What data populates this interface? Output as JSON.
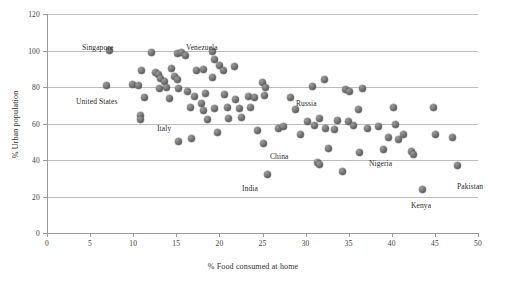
{
  "chart_data": {
    "type": "scatter",
    "title": "",
    "xlabel": "% Food consumed at home",
    "ylabel": "% Urban population",
    "xlim": [
      0,
      50
    ],
    "ylim": [
      0,
      120
    ],
    "xticks": [
      0,
      5,
      10,
      15,
      20,
      25,
      30,
      35,
      40,
      45,
      50
    ],
    "yticks": [
      0,
      20,
      40,
      60,
      80,
      100,
      120
    ],
    "grid": "horizontal",
    "legend": "none",
    "marker_color": "#6b6b6b",
    "points": [
      {
        "x": 7.2,
        "y": 100.0,
        "label": "Singapore"
      },
      {
        "x": 6.9,
        "y": 81.0,
        "label": ""
      },
      {
        "x": 9.9,
        "y": 81.3,
        "label": "United States"
      },
      {
        "x": 10.6,
        "y": 81.0,
        "label": ""
      },
      {
        "x": 11.0,
        "y": 89.0,
        "label": ""
      },
      {
        "x": 11.3,
        "y": 74.0,
        "label": ""
      },
      {
        "x": 10.9,
        "y": 64.5,
        "label": ""
      },
      {
        "x": 10.8,
        "y": 62.0,
        "label": ""
      },
      {
        "x": 12.1,
        "y": 99.0,
        "label": ""
      },
      {
        "x": 12.6,
        "y": 88.0,
        "label": ""
      },
      {
        "x": 12.9,
        "y": 87.0,
        "label": ""
      },
      {
        "x": 13.2,
        "y": 84.5,
        "label": ""
      },
      {
        "x": 13.6,
        "y": 83.0,
        "label": ""
      },
      {
        "x": 13.0,
        "y": 79.0,
        "label": ""
      },
      {
        "x": 13.9,
        "y": 80.0,
        "label": ""
      },
      {
        "x": 14.2,
        "y": 73.5,
        "label": "Italy"
      },
      {
        "x": 14.4,
        "y": 90.0,
        "label": ""
      },
      {
        "x": 14.8,
        "y": 86.0,
        "label": ""
      },
      {
        "x": 15.1,
        "y": 84.0,
        "label": ""
      },
      {
        "x": 15.3,
        "y": 79.0,
        "label": ""
      },
      {
        "x": 15.3,
        "y": 50.0,
        "label": ""
      },
      {
        "x": 15.1,
        "y": 98.5,
        "label": ""
      },
      {
        "x": 15.6,
        "y": 99.0,
        "label": ""
      },
      {
        "x": 16.1,
        "y": 97.5,
        "label": ""
      },
      {
        "x": 16.3,
        "y": 77.5,
        "label": ""
      },
      {
        "x": 16.6,
        "y": 68.5,
        "label": ""
      },
      {
        "x": 16.8,
        "y": 52.0,
        "label": ""
      },
      {
        "x": 17.4,
        "y": 89.0,
        "label": ""
      },
      {
        "x": 17.1,
        "y": 75.0,
        "label": ""
      },
      {
        "x": 17.9,
        "y": 71.0,
        "label": ""
      },
      {
        "x": 18.2,
        "y": 89.5,
        "label": ""
      },
      {
        "x": 18.4,
        "y": 76.5,
        "label": ""
      },
      {
        "x": 18.2,
        "y": 67.0,
        "label": ""
      },
      {
        "x": 18.6,
        "y": 62.0,
        "label": ""
      },
      {
        "x": 19.2,
        "y": 85.0,
        "label": ""
      },
      {
        "x": 19.4,
        "y": 68.0,
        "label": ""
      },
      {
        "x": 19.8,
        "y": 55.0,
        "label": ""
      },
      {
        "x": 19.2,
        "y": 99.5,
        "label": "Venezuela"
      },
      {
        "x": 19.4,
        "y": 95.0,
        "label": ""
      },
      {
        "x": 20.0,
        "y": 92.0,
        "label": ""
      },
      {
        "x": 20.5,
        "y": 89.0,
        "label": ""
      },
      {
        "x": 20.6,
        "y": 76.0,
        "label": ""
      },
      {
        "x": 20.9,
        "y": 68.5,
        "label": ""
      },
      {
        "x": 21.1,
        "y": 62.5,
        "label": ""
      },
      {
        "x": 21.8,
        "y": 91.0,
        "label": ""
      },
      {
        "x": 21.9,
        "y": 73.0,
        "label": ""
      },
      {
        "x": 22.3,
        "y": 68.0,
        "label": ""
      },
      {
        "x": 22.6,
        "y": 63.5,
        "label": ""
      },
      {
        "x": 23.4,
        "y": 75.0,
        "label": ""
      },
      {
        "x": 23.6,
        "y": 69.0,
        "label": ""
      },
      {
        "x": 24.1,
        "y": 74.5,
        "label": ""
      },
      {
        "x": 24.4,
        "y": 56.0,
        "label": ""
      },
      {
        "x": 25.0,
        "y": 82.5,
        "label": ""
      },
      {
        "x": 25.2,
        "y": 75.5,
        "label": ""
      },
      {
        "x": 25.4,
        "y": 79.5,
        "label": ""
      },
      {
        "x": 25.1,
        "y": 49.0,
        "label": ""
      },
      {
        "x": 25.6,
        "y": 32.0,
        "label": "India"
      },
      {
        "x": 26.8,
        "y": 57.0,
        "label": ""
      },
      {
        "x": 27.4,
        "y": 58.5,
        "label": ""
      },
      {
        "x": 28.2,
        "y": 74.0,
        "label": ""
      },
      {
        "x": 28.8,
        "y": 67.5,
        "label": "China"
      },
      {
        "x": 29.4,
        "y": 54.0,
        "label": ""
      },
      {
        "x": 30.2,
        "y": 61.0,
        "label": ""
      },
      {
        "x": 30.8,
        "y": 80.5,
        "label": ""
      },
      {
        "x": 31.0,
        "y": 59.0,
        "label": ""
      },
      {
        "x": 31.4,
        "y": 38.5,
        "label": ""
      },
      {
        "x": 31.6,
        "y": 37.5,
        "label": ""
      },
      {
        "x": 31.6,
        "y": 62.5,
        "label": ""
      },
      {
        "x": 32.2,
        "y": 84.0,
        "label": "Russia"
      },
      {
        "x": 32.3,
        "y": 57.0,
        "label": ""
      },
      {
        "x": 32.7,
        "y": 46.5,
        "label": ""
      },
      {
        "x": 33.4,
        "y": 56.5,
        "label": ""
      },
      {
        "x": 33.7,
        "y": 61.5,
        "label": ""
      },
      {
        "x": 34.3,
        "y": 33.5,
        "label": ""
      },
      {
        "x": 34.6,
        "y": 78.5,
        "label": ""
      },
      {
        "x": 35.1,
        "y": 77.5,
        "label": ""
      },
      {
        "x": 35.0,
        "y": 61.0,
        "label": ""
      },
      {
        "x": 35.6,
        "y": 59.0,
        "label": ""
      },
      {
        "x": 36.1,
        "y": 67.5,
        "label": ""
      },
      {
        "x": 36.3,
        "y": 44.0,
        "label": ""
      },
      {
        "x": 36.6,
        "y": 79.0,
        "label": ""
      },
      {
        "x": 37.2,
        "y": 57.0,
        "label": ""
      },
      {
        "x": 38.4,
        "y": 58.5,
        "label": ""
      },
      {
        "x": 39.0,
        "y": 45.5,
        "label": "Nigeria"
      },
      {
        "x": 39.6,
        "y": 52.5,
        "label": ""
      },
      {
        "x": 40.2,
        "y": 68.5,
        "label": ""
      },
      {
        "x": 40.4,
        "y": 59.5,
        "label": ""
      },
      {
        "x": 40.8,
        "y": 51.5,
        "label": ""
      },
      {
        "x": 41.4,
        "y": 54.0,
        "label": ""
      },
      {
        "x": 42.3,
        "y": 44.5,
        "label": ""
      },
      {
        "x": 42.5,
        "y": 43.0,
        "label": ""
      },
      {
        "x": 43.6,
        "y": 24.0,
        "label": "Kenya"
      },
      {
        "x": 44.8,
        "y": 68.5,
        "label": ""
      },
      {
        "x": 45.1,
        "y": 54.0,
        "label": ""
      },
      {
        "x": 47.0,
        "y": 52.5,
        "label": ""
      },
      {
        "x": 47.6,
        "y": 37.0,
        "label": "Pakistan"
      }
    ],
    "annotations": [
      {
        "text": "Singapore",
        "px": 82,
        "py": 43
      },
      {
        "text": "Venezuela",
        "px": 186,
        "py": 43
      },
      {
        "text": "United States",
        "px": 76,
        "py": 97
      },
      {
        "text": "Italy",
        "px": 157,
        "py": 124
      },
      {
        "text": "Venezuela_dup",
        "px": -999,
        "py": -999
      },
      {
        "text": "Russia",
        "px": 296,
        "py": 99
      },
      {
        "text": "China",
        "px": 270,
        "py": 152
      },
      {
        "text": "India",
        "px": 242,
        "py": 184
      },
      {
        "text": "Nigeria",
        "px": 369,
        "py": 159
      },
      {
        "text": "Kenya",
        "px": 411,
        "py": 201
      },
      {
        "text": "Pakistan",
        "px": 457,
        "py": 182
      }
    ]
  }
}
